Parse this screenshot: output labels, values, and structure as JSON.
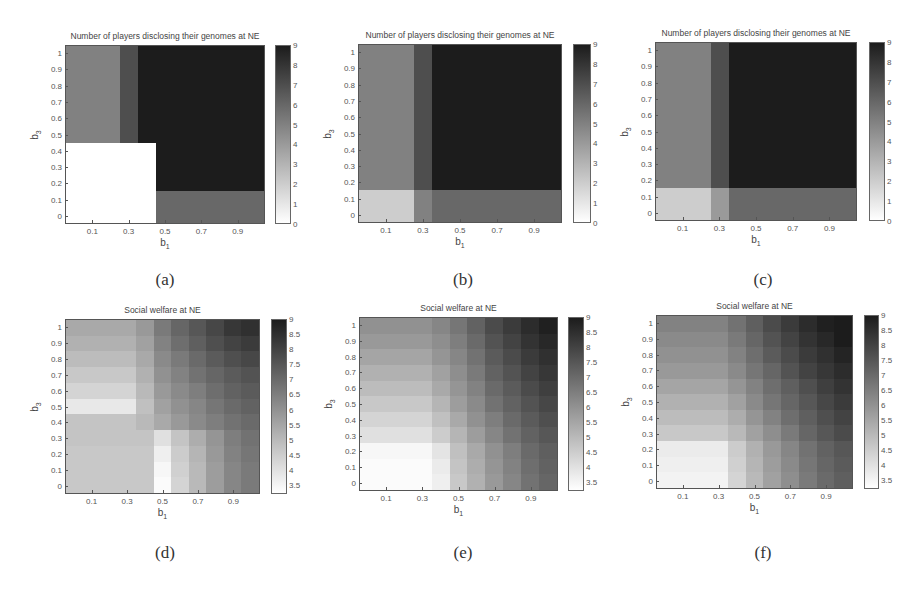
{
  "panels": [
    {
      "id": "a",
      "caption": "(a)",
      "title": "Number of players disclosing their genomes at NE",
      "xlabel": "b",
      "xlabel_sub": "1",
      "ylabel": "b",
      "ylabel_sub": "3",
      "box": {
        "left": 65,
        "top": 45,
        "right": 265,
        "bottom": 224
      },
      "cbar": {
        "left": 275,
        "right": 291,
        "top": 45,
        "bottom": 224
      },
      "caption_pos": {
        "x": 165,
        "y": 270
      },
      "cmin": 0,
      "cmax": 9,
      "cticks": [
        "0",
        "1",
        "2",
        "3",
        "4",
        "5",
        "6",
        "7",
        "8",
        "9"
      ]
    },
    {
      "id": "b",
      "caption": "(b)",
      "title": "Number of players disclosing their genomes at NE",
      "xlabel": "b",
      "xlabel_sub": "1",
      "ylabel": "b",
      "ylabel_sub": "3",
      "box": {
        "left": 358,
        "top": 44,
        "right": 562,
        "bottom": 223
      },
      "cbar": {
        "left": 573,
        "right": 591,
        "top": 44,
        "bottom": 223
      },
      "caption_pos": {
        "x": 463,
        "y": 270
      },
      "cmin": 0,
      "cmax": 9,
      "cticks": [
        "0",
        "1",
        "2",
        "3",
        "4",
        "5",
        "6",
        "7",
        "8",
        "9"
      ]
    },
    {
      "id": "c",
      "caption": "(c)",
      "title": "Number of players disclosing their genomes at NE",
      "xlabel": "b",
      "xlabel_sub": "1",
      "ylabel": "b",
      "ylabel_sub": "3",
      "box": {
        "left": 655,
        "top": 42,
        "right": 857,
        "bottom": 221
      },
      "cbar": {
        "left": 869,
        "right": 885,
        "top": 42,
        "bottom": 221
      },
      "caption_pos": {
        "x": 763,
        "y": 270
      },
      "cmin": 0,
      "cmax": 9,
      "cticks": [
        "0",
        "1",
        "2",
        "3",
        "4",
        "5",
        "6",
        "7",
        "8",
        "9"
      ]
    },
    {
      "id": "d",
      "caption": "(d)",
      "title": "Social welfare at NE",
      "xlabel": "b",
      "xlabel_sub": "1",
      "ylabel": "b",
      "ylabel_sub": "3",
      "box": {
        "left": 65,
        "top": 319,
        "right": 260,
        "bottom": 494
      },
      "cbar": {
        "left": 271,
        "right": 287,
        "top": 319,
        "bottom": 494
      },
      "caption_pos": {
        "x": 165,
        "y": 543
      },
      "cmin": 3.2,
      "cmax": 9,
      "cticks": [
        "3.5",
        "4",
        "4.5",
        "5",
        "5.5",
        "6",
        "6.5",
        "7",
        "7.5",
        "8",
        "8.5",
        "9"
      ]
    },
    {
      "id": "e",
      "caption": "(e)",
      "title": "Social welfare at NE",
      "xlabel": "b",
      "xlabel_sub": "1",
      "ylabel": "b",
      "ylabel_sub": "3",
      "box": {
        "left": 359,
        "top": 317,
        "right": 558,
        "bottom": 491
      },
      "cbar": {
        "left": 568,
        "right": 584,
        "top": 317,
        "bottom": 491
      },
      "caption_pos": {
        "x": 463,
        "y": 543
      },
      "cmin": 3.2,
      "cmax": 9,
      "cticks": [
        "3.5",
        "4",
        "4.5",
        "5",
        "5.5",
        "6",
        "6.5",
        "7",
        "7.5",
        "8",
        "8.5",
        "9"
      ]
    },
    {
      "id": "f",
      "caption": "(f)",
      "title": "Social welfare at NE",
      "xlabel": "b",
      "xlabel_sub": "1",
      "ylabel": "b",
      "ylabel_sub": "3",
      "box": {
        "left": 656,
        "top": 315,
        "right": 853,
        "bottom": 489
      },
      "cbar": {
        "left": 864,
        "right": 879,
        "top": 315,
        "bottom": 489
      },
      "caption_pos": {
        "x": 763,
        "y": 543
      },
      "cmin": 3.2,
      "cmax": 9,
      "cticks": [
        "3.5",
        "4",
        "4.5",
        "5",
        "5.5",
        "6",
        "6.5",
        "7",
        "7.5",
        "8",
        "8.5",
        "9"
      ]
    }
  ],
  "axes": {
    "xticks": [
      "0.1",
      "0.3",
      "0.5",
      "0.7",
      "0.9"
    ],
    "xtick_values": [
      0.1,
      0.3,
      0.5,
      0.7,
      0.9
    ],
    "yticks": [
      "0",
      "0.1",
      "0.2",
      "0.3",
      "0.4",
      "0.5",
      "0.6",
      "0.7",
      "0.8",
      "0.9",
      "1"
    ],
    "ytick_values": [
      0,
      0.1,
      0.2,
      0.3,
      0.4,
      0.5,
      0.6,
      0.7,
      0.8,
      0.9,
      1
    ],
    "range": [
      -0.05,
      1.05
    ]
  },
  "chart_data": [
    {
      "type": "heatmap",
      "panel": "a",
      "title": "Number of players disclosing their genomes at NE",
      "xlabel": "b1",
      "ylabel": "b3",
      "x": [
        0,
        0.1,
        0.2,
        0.3,
        0.4,
        0.5,
        0.6,
        0.7,
        0.8,
        0.9,
        1.0
      ],
      "y": [
        0,
        0.1,
        0.2,
        0.3,
        0.4,
        0.5,
        0.6,
        0.7,
        0.8,
        0.9,
        1.0
      ],
      "zlim": [
        0,
        9
      ],
      "z_rows_bottom_to_top": [
        [
          0,
          0,
          0,
          0,
          0,
          6,
          6,
          6,
          6,
          6,
          6
        ],
        [
          0,
          0,
          0,
          0,
          0,
          6,
          6,
          6,
          6,
          6,
          6
        ],
        [
          0,
          0,
          0,
          0,
          0,
          9,
          9,
          9,
          9,
          9,
          9
        ],
        [
          0,
          0,
          0,
          0,
          0,
          9,
          9,
          9,
          9,
          9,
          9
        ],
        [
          0,
          0,
          0,
          0,
          0,
          9,
          9,
          9,
          9,
          9,
          9
        ],
        [
          5,
          5,
          5,
          7,
          9,
          9,
          9,
          9,
          9,
          9,
          9
        ],
        [
          5,
          5,
          5,
          7,
          9,
          9,
          9,
          9,
          9,
          9,
          9
        ],
        [
          5,
          5,
          5,
          7,
          9,
          9,
          9,
          9,
          9,
          9,
          9
        ],
        [
          5,
          5,
          5,
          7,
          9,
          9,
          9,
          9,
          9,
          9,
          9
        ],
        [
          5,
          5,
          5,
          7,
          9,
          9,
          9,
          9,
          9,
          9,
          9
        ],
        [
          5,
          5,
          5,
          7,
          9,
          9,
          9,
          9,
          9,
          9,
          9
        ]
      ]
    },
    {
      "type": "heatmap",
      "panel": "b",
      "title": "Number of players disclosing their genomes at NE",
      "xlabel": "b1",
      "ylabel": "b3",
      "x": [
        0,
        0.1,
        0.2,
        0.3,
        0.4,
        0.5,
        0.6,
        0.7,
        0.8,
        0.9,
        1.0
      ],
      "y": [
        0,
        0.1,
        0.2,
        0.3,
        0.4,
        0.5,
        0.6,
        0.7,
        0.8,
        0.9,
        1.0
      ],
      "zlim": [
        0,
        9
      ],
      "z_rows_bottom_to_top": [
        [
          2,
          2,
          2,
          5,
          6,
          6,
          6,
          6,
          6,
          6,
          6
        ],
        [
          2,
          2,
          2,
          5,
          6,
          6,
          6,
          6,
          6,
          6,
          6
        ],
        [
          5,
          5,
          5,
          7,
          9,
          9,
          9,
          9,
          9,
          9,
          9
        ],
        [
          5,
          5,
          5,
          7,
          9,
          9,
          9,
          9,
          9,
          9,
          9
        ],
        [
          5,
          5,
          5,
          7,
          9,
          9,
          9,
          9,
          9,
          9,
          9
        ],
        [
          5,
          5,
          5,
          7,
          9,
          9,
          9,
          9,
          9,
          9,
          9
        ],
        [
          5,
          5,
          5,
          7,
          9,
          9,
          9,
          9,
          9,
          9,
          9
        ],
        [
          5,
          5,
          5,
          7,
          9,
          9,
          9,
          9,
          9,
          9,
          9
        ],
        [
          5,
          5,
          5,
          7,
          9,
          9,
          9,
          9,
          9,
          9,
          9
        ],
        [
          5,
          5,
          5,
          7,
          9,
          9,
          9,
          9,
          9,
          9,
          9
        ],
        [
          5,
          5,
          5,
          7,
          9,
          9,
          9,
          9,
          9,
          9,
          9
        ]
      ]
    },
    {
      "type": "heatmap",
      "panel": "c",
      "title": "Number of players disclosing their genomes at NE",
      "xlabel": "b1",
      "ylabel": "b3",
      "x": [
        0,
        0.1,
        0.2,
        0.3,
        0.4,
        0.5,
        0.6,
        0.7,
        0.8,
        0.9,
        1.0
      ],
      "y": [
        0,
        0.1,
        0.2,
        0.3,
        0.4,
        0.5,
        0.6,
        0.7,
        0.8,
        0.9,
        1.0
      ],
      "zlim": [
        0,
        9
      ],
      "z_rows_bottom_to_top": [
        [
          2,
          2,
          2,
          4,
          6,
          6,
          6,
          6,
          6,
          6,
          6
        ],
        [
          2,
          2,
          2,
          4,
          6,
          6,
          6,
          6,
          6,
          6,
          6
        ],
        [
          5,
          5,
          5,
          7,
          9,
          9,
          9,
          9,
          9,
          9,
          9
        ],
        [
          5,
          5,
          5,
          7,
          9,
          9,
          9,
          9,
          9,
          9,
          9
        ],
        [
          5,
          5,
          5,
          7,
          9,
          9,
          9,
          9,
          9,
          9,
          9
        ],
        [
          5,
          5,
          5,
          7,
          9,
          9,
          9,
          9,
          9,
          9,
          9
        ],
        [
          5,
          5,
          5,
          7,
          9,
          9,
          9,
          9,
          9,
          9,
          9
        ],
        [
          5,
          5,
          5,
          7,
          9,
          9,
          9,
          9,
          9,
          9,
          9
        ],
        [
          5,
          5,
          5,
          7,
          9,
          9,
          9,
          9,
          9,
          9,
          9
        ],
        [
          5,
          5,
          5,
          7,
          9,
          9,
          9,
          9,
          9,
          9,
          9
        ],
        [
          5,
          5,
          5,
          7,
          9,
          9,
          9,
          9,
          9,
          9,
          9
        ]
      ]
    },
    {
      "type": "heatmap",
      "panel": "d",
      "title": "Social welfare at NE",
      "xlabel": "b1",
      "ylabel": "b3",
      "x": [
        0,
        0.1,
        0.2,
        0.3,
        0.4,
        0.5,
        0.6,
        0.7,
        0.8,
        0.9,
        1.0
      ],
      "y": [
        0,
        0.1,
        0.2,
        0.3,
        0.4,
        0.5,
        0.6,
        0.7,
        0.8,
        0.9,
        1.0
      ],
      "zlim": [
        3.2,
        9
      ],
      "z_rows_bottom_to_top": [
        [
          4.6,
          4.6,
          4.6,
          4.6,
          4.6,
          3.3,
          4.3,
          5.0,
          5.7,
          6.3,
          6.6
        ],
        [
          4.6,
          4.6,
          4.6,
          4.6,
          4.6,
          3.4,
          4.4,
          5.0,
          5.7,
          6.3,
          6.6
        ],
        [
          4.6,
          4.6,
          4.6,
          4.6,
          4.6,
          3.6,
          4.5,
          5.1,
          5.8,
          6.4,
          6.7
        ],
        [
          4.7,
          4.7,
          4.7,
          4.7,
          4.7,
          4.0,
          4.7,
          5.3,
          5.9,
          6.5,
          6.8
        ],
        [
          4.7,
          4.7,
          4.7,
          4.7,
          5.0,
          5.4,
          5.8,
          6.2,
          6.5,
          6.8,
          7.0
        ],
        [
          3.8,
          3.8,
          3.8,
          3.8,
          4.8,
          5.6,
          6.0,
          6.3,
          6.7,
          7.0,
          7.2
        ],
        [
          4.3,
          4.3,
          4.3,
          4.3,
          5.0,
          5.8,
          6.2,
          6.5,
          6.9,
          7.2,
          7.4
        ],
        [
          4.6,
          4.6,
          4.6,
          4.6,
          5.2,
          6.0,
          6.4,
          6.8,
          7.1,
          7.4,
          7.6
        ],
        [
          4.9,
          4.9,
          4.9,
          4.9,
          5.4,
          6.2,
          6.6,
          7.0,
          7.4,
          7.7,
          7.9
        ],
        [
          5.2,
          5.2,
          5.2,
          5.2,
          5.6,
          6.4,
          6.9,
          7.3,
          7.7,
          8.0,
          8.2
        ],
        [
          5.4,
          5.4,
          5.4,
          5.4,
          5.8,
          6.6,
          7.1,
          7.5,
          7.9,
          8.3,
          8.5
        ]
      ]
    },
    {
      "type": "heatmap",
      "panel": "e",
      "title": "Social welfare at NE",
      "xlabel": "b1",
      "ylabel": "b3",
      "x": [
        0,
        0.1,
        0.2,
        0.3,
        0.4,
        0.5,
        0.6,
        0.7,
        0.8,
        0.9,
        1.0
      ],
      "y": [
        0,
        0.1,
        0.2,
        0.3,
        0.4,
        0.5,
        0.6,
        0.7,
        0.8,
        0.9,
        1.0
      ],
      "zlim": [
        3.2,
        9
      ],
      "z_rows_bottom_to_top": [
        [
          3.3,
          3.3,
          3.3,
          3.3,
          3.6,
          4.6,
          5.2,
          5.8,
          6.3,
          6.8,
          7.1
        ],
        [
          3.3,
          3.3,
          3.3,
          3.3,
          3.7,
          4.7,
          5.3,
          5.9,
          6.4,
          6.9,
          7.2
        ],
        [
          3.4,
          3.4,
          3.4,
          3.4,
          3.9,
          4.8,
          5.4,
          6.0,
          6.5,
          7.0,
          7.3
        ],
        [
          4.0,
          4.0,
          4.0,
          4.0,
          4.5,
          5.1,
          5.7,
          6.3,
          6.8,
          7.2,
          7.5
        ],
        [
          4.3,
          4.3,
          4.3,
          4.3,
          4.8,
          5.4,
          6.0,
          6.5,
          7.0,
          7.4,
          7.7
        ],
        [
          4.6,
          4.6,
          4.6,
          4.6,
          5.1,
          5.7,
          6.2,
          6.8,
          7.2,
          7.6,
          7.9
        ],
        [
          4.9,
          4.9,
          4.9,
          4.9,
          5.4,
          5.9,
          6.4,
          7.0,
          7.4,
          7.8,
          8.1
        ],
        [
          5.2,
          5.2,
          5.2,
          5.2,
          5.6,
          6.1,
          6.6,
          7.2,
          7.6,
          8.0,
          8.3
        ],
        [
          5.5,
          5.5,
          5.5,
          5.5,
          5.9,
          6.3,
          6.8,
          7.4,
          7.8,
          8.2,
          8.5
        ],
        [
          5.8,
          5.8,
          5.8,
          5.8,
          6.1,
          6.5,
          7.0,
          7.6,
          8.0,
          8.4,
          8.7
        ],
        [
          6.0,
          6.0,
          6.0,
          6.0,
          6.3,
          6.7,
          7.2,
          7.8,
          8.2,
          8.6,
          8.9
        ]
      ]
    },
    {
      "type": "heatmap",
      "panel": "f",
      "title": "Social welfare at NE",
      "xlabel": "b1",
      "ylabel": "b3",
      "x": [
        0,
        0.1,
        0.2,
        0.3,
        0.4,
        0.5,
        0.6,
        0.7,
        0.8,
        0.9,
        1.0
      ],
      "y": [
        0,
        0.1,
        0.2,
        0.3,
        0.4,
        0.5,
        0.6,
        0.7,
        0.8,
        0.9,
        1.0
      ],
      "zlim": [
        3.2,
        9
      ],
      "z_rows_bottom_to_top": [
        [
          3.5,
          3.5,
          3.5,
          3.5,
          4.3,
          5.0,
          5.6,
          6.1,
          6.6,
          7.0,
          7.3
        ],
        [
          3.6,
          3.6,
          3.6,
          3.6,
          4.4,
          5.1,
          5.7,
          6.2,
          6.7,
          7.1,
          7.4
        ],
        [
          3.7,
          3.7,
          3.7,
          3.7,
          4.5,
          5.2,
          5.8,
          6.3,
          6.8,
          7.2,
          7.5
        ],
        [
          4.6,
          4.6,
          4.6,
          4.6,
          5.0,
          5.6,
          6.1,
          6.6,
          7.1,
          7.5,
          7.8
        ],
        [
          4.9,
          4.9,
          4.9,
          4.9,
          5.3,
          5.9,
          6.4,
          6.9,
          7.3,
          7.7,
          8.0
        ],
        [
          5.2,
          5.2,
          5.2,
          5.2,
          5.6,
          6.2,
          6.7,
          7.1,
          7.5,
          7.9,
          8.2
        ],
        [
          5.5,
          5.5,
          5.5,
          5.5,
          5.9,
          6.4,
          6.9,
          7.3,
          7.7,
          8.1,
          8.4
        ],
        [
          5.8,
          5.8,
          5.8,
          5.8,
          6.2,
          6.7,
          7.1,
          7.6,
          8.0,
          8.3,
          8.6
        ],
        [
          6.0,
          6.0,
          6.0,
          6.0,
          6.4,
          6.9,
          7.4,
          7.8,
          8.2,
          8.5,
          8.8
        ],
        [
          6.2,
          6.2,
          6.2,
          6.2,
          6.6,
          7.1,
          7.6,
          8.0,
          8.4,
          8.7,
          9.0
        ],
        [
          6.4,
          6.4,
          6.4,
          6.4,
          6.8,
          7.3,
          7.8,
          8.2,
          8.6,
          8.9,
          9.0
        ]
      ]
    }
  ]
}
